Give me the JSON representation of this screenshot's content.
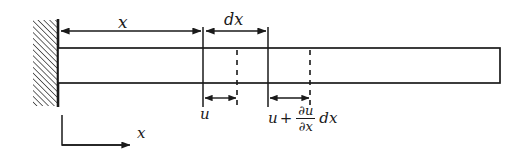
{
  "figure": {
    "type": "engineering-diagram",
    "width": 527,
    "height": 163,
    "background_color": "#ffffff",
    "line_color": "#1a1a1a"
  },
  "labels": {
    "x_dimension": "x",
    "dx_dimension": "dx",
    "u_displacement": "u",
    "axis_x": "x",
    "expression": {
      "term1": "u",
      "operator": "+",
      "numerator": "∂u",
      "denominator": "∂x",
      "trailing": "dx",
      "full_text": "u + ∂u/∂x dx"
    }
  },
  "geometry": {
    "wall": {
      "x": 33,
      "y": 20,
      "width": 25,
      "height": 86,
      "hatch_angle_deg": 45,
      "hatch_spacing": 4
    },
    "wall_face_line": {
      "x": 58,
      "y1": 20,
      "y2": 106
    },
    "beam": {
      "x1": 58,
      "y1": 48,
      "x2": 500,
      "y2": 83
    },
    "section_lines": [
      {
        "name": "section-left-solid",
        "x": 203,
        "y1": 28,
        "y2": 106,
        "style": "solid"
      },
      {
        "name": "section-left-dashed",
        "x": 237,
        "y1": 48,
        "y2": 83,
        "style": "dashed"
      },
      {
        "name": "section-right-solid",
        "x": 268,
        "y1": 28,
        "y2": 106,
        "style": "solid"
      },
      {
        "name": "section-right-dashed",
        "x": 310,
        "y1": 48,
        "y2": 83,
        "style": "dashed"
      }
    ],
    "dimension_lines": [
      {
        "name": "x-dimension",
        "y": 31,
        "x1": 60,
        "x2": 202,
        "arrows": "both"
      },
      {
        "name": "dx-dimension",
        "y": 31,
        "x1": 205,
        "x2": 267,
        "arrows": "both"
      },
      {
        "name": "u-dimension",
        "y": 98,
        "x1": 205,
        "x2": 236,
        "arrows": "both"
      },
      {
        "name": "u-plus-dudx-dimension",
        "y": 98,
        "x1": 270,
        "x2": 309,
        "arrows": "both"
      }
    ],
    "axis_indicator": {
      "vertical": {
        "x": 62,
        "y1": 115,
        "y2": 145
      },
      "horizontal": {
        "y": 145,
        "x1": 62,
        "x2": 130
      },
      "arrow": "right"
    }
  }
}
